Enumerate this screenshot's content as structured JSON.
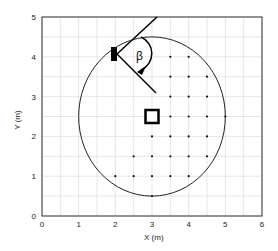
{
  "chart_data": {
    "type": "scatter",
    "title": "",
    "xlabel": "X (m)",
    "ylabel": "Y (m)",
    "xlim": [
      0,
      6
    ],
    "ylim": [
      0,
      5
    ],
    "xticks": [
      "0",
      "1",
      "2",
      "3",
      "4",
      "5",
      "6"
    ],
    "yticks": [
      "0",
      "1",
      "2",
      "3",
      "4",
      "5"
    ],
    "grid": true,
    "grid_step": 0.5,
    "circle": {
      "cx": 3,
      "cy": 2.5,
      "r": 2
    },
    "points": [
      [
        3.5,
        4
      ],
      [
        4,
        4
      ],
      [
        3.5,
        3.5
      ],
      [
        4,
        3.5
      ],
      [
        4.5,
        3.5
      ],
      [
        3.5,
        3
      ],
      [
        4,
        3
      ],
      [
        4.5,
        3
      ],
      [
        3.5,
        2.5
      ],
      [
        4,
        2.5
      ],
      [
        4.5,
        2.5
      ],
      [
        5,
        2.5
      ],
      [
        3,
        2
      ],
      [
        3.5,
        2
      ],
      [
        4,
        2
      ],
      [
        4.5,
        2
      ],
      [
        2.5,
        1.5
      ],
      [
        3,
        1.5
      ],
      [
        3.5,
        1.5
      ],
      [
        4,
        1.5
      ],
      [
        4.5,
        1.5
      ],
      [
        2,
        1
      ],
      [
        2.5,
        1
      ],
      [
        3,
        1
      ],
      [
        3.5,
        1
      ],
      [
        4,
        1
      ],
      [
        3,
        0.5
      ]
    ],
    "square_marker": {
      "x": 3,
      "y": 2.5
    },
    "source_marker": {
      "x": 2,
      "y": 4.1
    },
    "annotation": "β"
  }
}
